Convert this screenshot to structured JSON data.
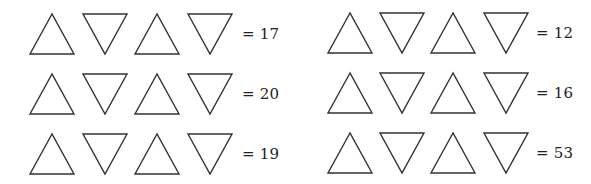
{
  "puzzle": {
    "stroke_color": "#333333",
    "background": "#ffffff",
    "groups": [
      {
        "rows": [
          {
            "shapes": [
              "up-triangle",
              "down-triangle",
              "up-triangle",
              "down-triangle"
            ],
            "result": "= 17",
            "value": 17
          },
          {
            "shapes": [
              "up-triangle",
              "down-triangle",
              "up-triangle",
              "down-triangle"
            ],
            "result": "= 20",
            "value": 20
          },
          {
            "shapes": [
              "up-triangle",
              "down-triangle",
              "up-triangle",
              "down-triangle"
            ],
            "result": "= 19",
            "value": 19
          }
        ]
      },
      {
        "rows": [
          {
            "shapes": [
              "up-triangle",
              "down-triangle",
              "up-triangle",
              "down-triangle"
            ],
            "result": "= 12",
            "value": 12
          },
          {
            "shapes": [
              "up-triangle",
              "down-triangle",
              "up-triangle",
              "down-triangle"
            ],
            "result": "= 16",
            "value": 16
          },
          {
            "shapes": [
              "up-triangle",
              "down-triangle",
              "up-triangle",
              "down-triangle"
            ],
            "result": "= 53",
            "value": 53
          }
        ]
      }
    ]
  }
}
